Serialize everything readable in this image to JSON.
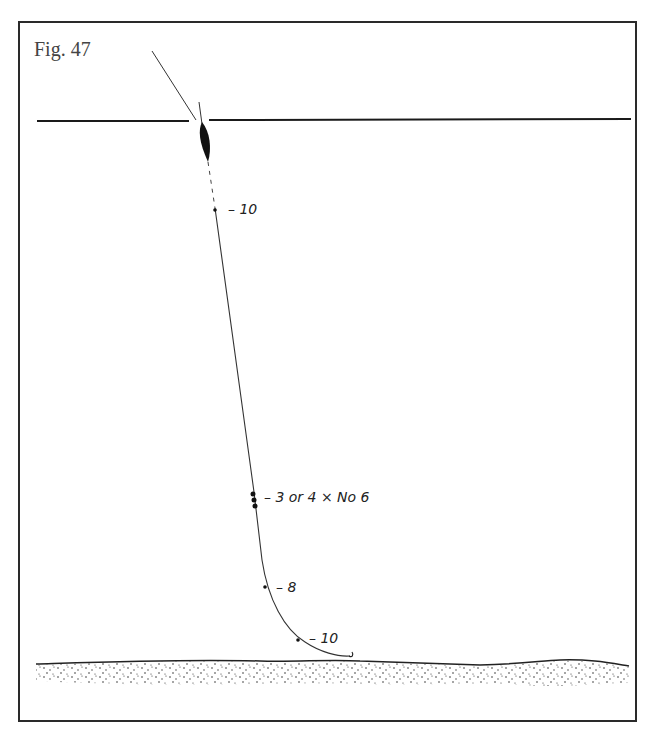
{
  "figure": {
    "title": "Fig. 47"
  },
  "labels": {
    "shot_top": "– 10",
    "shot_bulk": "– 3 or 4 × No 6",
    "shot_mid": "– 8",
    "shot_bottom": "– 10"
  },
  "colors": {
    "ink": "#1a1a1a",
    "frame": "#2a2a2a",
    "background": "#ffffff"
  }
}
